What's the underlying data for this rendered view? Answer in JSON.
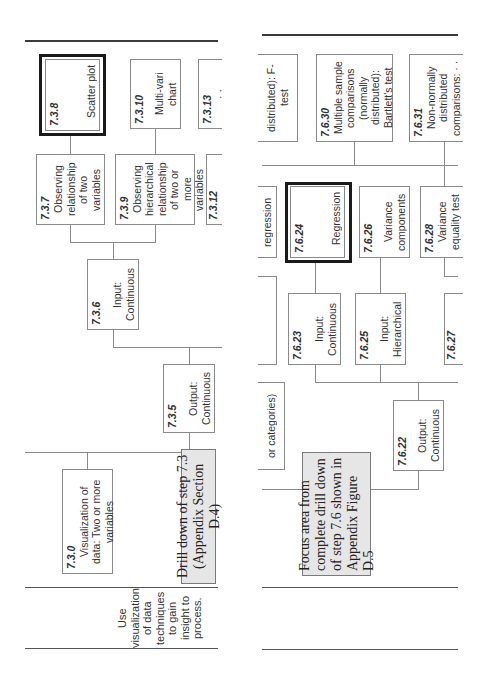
{
  "left_panel": {
    "boxes": {
      "b738": {
        "number": "7.3.8",
        "text": "Scatter plot"
      },
      "b7310": {
        "number": "7.3.10",
        "text": "Multi-vari chart"
      },
      "b7313": {
        "number": "7.3.13",
        "text": "· ·"
      },
      "b737": {
        "number": "7.3.7",
        "text": "Observing relationship of two variables"
      },
      "b739": {
        "number": "7.3.9",
        "text": "Observing hierarchical relationship of two or more variables"
      },
      "b7312": {
        "number": "7.3.12",
        "text": "··"
      },
      "b736": {
        "number": "7.3.6",
        "text": "Input: Continuous"
      },
      "b735": {
        "number": "7.3.5",
        "text": "Output: Continuous"
      },
      "b730": {
        "number": "7.3.0",
        "text": "Visualization of data: Two or more variables"
      }
    },
    "drill_down": "Drill down of step 7.3 (Appendix  Section D.4)",
    "side_label": "Use visualization of data techniques to gain insight to process."
  },
  "right_panel": {
    "boxes": {
      "ftest": {
        "text": "distributed): F-test"
      },
      "b7630": {
        "number": "7.6.30",
        "text": "Multiple sample comparisons (normally distributed): Bartlett's test"
      },
      "b7631": {
        "number": "7.6.31",
        "text": "Non-normally distributed comparisons: · ·"
      },
      "regression_partial": {
        "text": "regression"
      },
      "b7624": {
        "number": "7.6.24",
        "text": "Regression"
      },
      "b7626": {
        "number": "7.6.26",
        "text": "Variance components"
      },
      "b7628": {
        "number": "7.6.28",
        "text": "Variance equality test"
      },
      "b7623": {
        "number": "7.6.23",
        "text": "Input: Continuous"
      },
      "b7625": {
        "number": "7.6.25",
        "text": "Input: Hierarchical"
      },
      "b7627": {
        "number": "7.6.27",
        "text": ""
      },
      "b7622": {
        "number": "7.6.22",
        "text": "Output: Continuous"
      },
      "categories_partial": {
        "text": "or categories)"
      }
    },
    "focus_area": "Focus area from complete drill down of step 7.6 shown in Appendix Figure D.5"
  }
}
